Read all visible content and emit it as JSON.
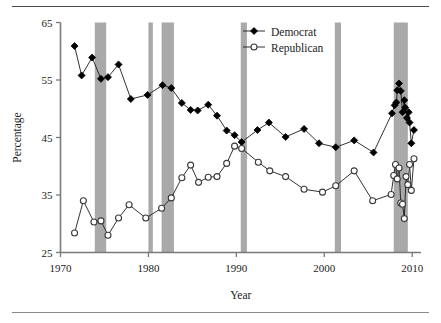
{
  "figure": {
    "has_top_rule": true,
    "has_bottom_rule": true,
    "background": "#ffffff"
  },
  "axes": {
    "y_title": "Percentage",
    "x_title": "Year",
    "y_ticks": [
      25,
      35,
      45,
      55,
      65
    ],
    "x_ticks": [
      1970,
      1980,
      1990,
      2000,
      2010
    ],
    "axis_color": "#7a7a7a",
    "label_color": "#1b1b1b"
  },
  "legend": {
    "position": "top-center-right",
    "entries": [
      {
        "label": "Democrat",
        "marker": "filled-diamond",
        "color": "#000000"
      },
      {
        "label": "Republican",
        "marker": "open-circle",
        "color": "#000000"
      }
    ]
  },
  "recession_bands": {
    "color": "#a9a9a9",
    "spans": [
      {
        "start": 1973.9,
        "end": 1975.2
      },
      {
        "start": 1980.0,
        "end": 1980.5
      },
      {
        "start": 1981.5,
        "end": 1982.9
      },
      {
        "start": 1990.5,
        "end": 1991.2
      },
      {
        "start": 2001.2,
        "end": 2001.9
      },
      {
        "start": 2007.9,
        "end": 2009.5
      }
    ]
  },
  "chart_data": {
    "type": "line",
    "title": "",
    "xlabel": "Year",
    "ylabel": "Percentage",
    "xlim": [
      1970,
      2011
    ],
    "ylim": [
      25,
      65
    ],
    "grid": false,
    "legend_position": "top-right",
    "series": [
      {
        "name": "Democrat",
        "marker": "filled-diamond",
        "color": "#000000",
        "points": [
          [
            1971.6,
            60.9
          ],
          [
            1972.4,
            55.8
          ],
          [
            1973.6,
            58.9
          ],
          [
            1974.6,
            55.2
          ],
          [
            1975.4,
            55.5
          ],
          [
            1976.6,
            57.7
          ],
          [
            1978.0,
            51.7
          ],
          [
            1979.9,
            52.4
          ],
          [
            1981.6,
            54.1
          ],
          [
            1982.6,
            53.6
          ],
          [
            1983.8,
            51.0
          ],
          [
            1984.8,
            49.8
          ],
          [
            1985.6,
            49.7
          ],
          [
            1986.8,
            50.7
          ],
          [
            1987.8,
            48.8
          ],
          [
            1988.9,
            46.2
          ],
          [
            1989.8,
            45.4
          ],
          [
            1990.6,
            44.2
          ],
          [
            1992.4,
            46.3
          ],
          [
            1993.7,
            47.6
          ],
          [
            1995.6,
            45.1
          ],
          [
            1997.7,
            46.5
          ],
          [
            1999.4,
            44.0
          ],
          [
            2001.3,
            43.3
          ],
          [
            2003.4,
            44.5
          ],
          [
            2005.6,
            42.4
          ],
          [
            2007.7,
            49.2
          ],
          [
            2008.0,
            50.6
          ],
          [
            2008.2,
            51.1
          ],
          [
            2008.3,
            53.2
          ],
          [
            2008.5,
            54.4
          ],
          [
            2008.7,
            53.1
          ],
          [
            2008.9,
            49.4
          ],
          [
            2009.1,
            51.5
          ],
          [
            2009.2,
            50.2
          ],
          [
            2009.4,
            48.4
          ],
          [
            2009.6,
            49.4
          ],
          [
            2009.7,
            47.6
          ],
          [
            2009.9,
            44.0
          ],
          [
            2010.2,
            46.3
          ]
        ]
      },
      {
        "name": "Republican",
        "marker": "open-circle",
        "color": "#000000",
        "points": [
          [
            1971.6,
            28.4
          ],
          [
            1972.6,
            34.0
          ],
          [
            1973.8,
            30.3
          ],
          [
            1974.6,
            30.5
          ],
          [
            1975.4,
            28.0
          ],
          [
            1976.6,
            31.0
          ],
          [
            1977.8,
            33.3
          ],
          [
            1979.7,
            31.0
          ],
          [
            1981.5,
            32.7
          ],
          [
            1982.6,
            34.5
          ],
          [
            1983.8,
            38.0
          ],
          [
            1984.8,
            40.2
          ],
          [
            1985.7,
            37.2
          ],
          [
            1986.8,
            38.1
          ],
          [
            1987.8,
            38.2
          ],
          [
            1988.9,
            40.5
          ],
          [
            1989.8,
            43.5
          ],
          [
            1990.6,
            43.1
          ],
          [
            1992.5,
            40.7
          ],
          [
            1993.8,
            39.2
          ],
          [
            1995.6,
            38.2
          ],
          [
            1997.7,
            36.0
          ],
          [
            1999.8,
            35.5
          ],
          [
            2001.3,
            36.6
          ],
          [
            2003.4,
            39.2
          ],
          [
            2005.5,
            34.0
          ],
          [
            2007.6,
            35.1
          ],
          [
            2007.9,
            38.4
          ],
          [
            2008.1,
            40.3
          ],
          [
            2008.3,
            37.8
          ],
          [
            2008.5,
            39.7
          ],
          [
            2008.7,
            33.6
          ],
          [
            2008.9,
            33.4
          ],
          [
            2009.1,
            30.9
          ],
          [
            2009.3,
            38.2
          ],
          [
            2009.5,
            36.8
          ],
          [
            2009.7,
            40.3
          ],
          [
            2009.9,
            35.8
          ],
          [
            2010.2,
            41.3
          ]
        ]
      }
    ]
  }
}
